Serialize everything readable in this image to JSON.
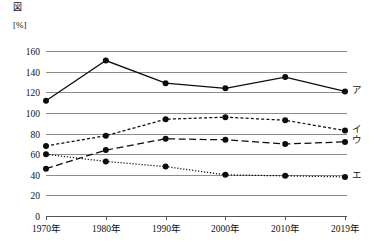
{
  "figure": {
    "title": "図",
    "unit_label": "[%]"
  },
  "chart_data": {
    "type": "line",
    "title": "図",
    "xlabel": "",
    "ylabel": "[%]",
    "ylim": [
      0,
      170
    ],
    "yticks": [
      0,
      20,
      40,
      60,
      80,
      100,
      120,
      140,
      160
    ],
    "ytick_labels": [
      "0",
      "20",
      "40",
      "60",
      "80",
      "100",
      "120",
      "140",
      "160"
    ],
    "grid": true,
    "legend_position": "right-inline",
    "categories": [
      "1970年",
      "1980年",
      "1990年",
      "2000年",
      "2010年",
      "2019年"
    ],
    "series": [
      {
        "name": "ア",
        "label": "ア",
        "style": "solid",
        "values": [
          112,
          151,
          129,
          124,
          135,
          121
        ]
      },
      {
        "name": "イ",
        "label": "イ",
        "style": "dashed-fine",
        "values": [
          68,
          78,
          94,
          96,
          93,
          83
        ]
      },
      {
        "name": "ウ",
        "label": "ウ",
        "style": "dashed-long",
        "values": [
          46,
          64,
          75,
          74,
          70,
          72
        ]
      },
      {
        "name": "エ",
        "label": "エ",
        "style": "dotted",
        "values": [
          60,
          53,
          48,
          40,
          39,
          38
        ]
      }
    ]
  }
}
